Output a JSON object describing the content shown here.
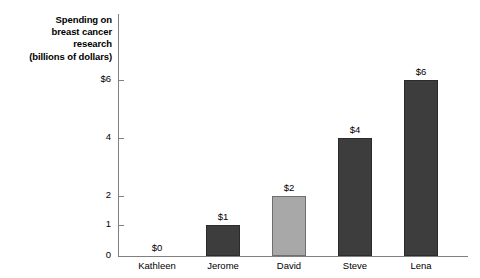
{
  "chart_data": {
    "type": "bar",
    "title": "Spending on breast cancer research (billions of dollars)",
    "title_lines": [
      "Spending on",
      "breast cancer",
      "research",
      "(billions of dollars)"
    ],
    "xlabel": "",
    "ylabel": "Spending on breast cancer research (billions of dollars)",
    "categories": [
      "Kathleen",
      "Jerome",
      "David",
      "Steve",
      "Lena"
    ],
    "values": [
      0,
      1,
      2,
      4,
      6
    ],
    "value_labels": [
      "$0",
      "$1",
      "$2",
      "$4",
      "$6"
    ],
    "bar_styles": [
      "dark",
      "dark",
      "light",
      "dark",
      "dark"
    ],
    "ylim": [
      0,
      6
    ],
    "y_ticks": [
      0,
      1,
      2,
      4,
      6
    ],
    "y_tick_labels": [
      "0",
      "1",
      "2",
      "4",
      "$6"
    ],
    "grid": false,
    "legend": null,
    "colors": {
      "bar_dark": "#3d3d3d",
      "bar_light": "#a8a8a8",
      "bar_outline": "#2b2b2b",
      "axis": "#808080",
      "text": "#000000",
      "background": "#ffffff"
    }
  },
  "geometry": {
    "y_tick_positions": {
      "0": 256,
      "1": 225,
      "2": 196,
      "4": 138,
      "6": 80
    },
    "bar_left": [
      140,
      206,
      272,
      338,
      404
    ],
    "bar_width": 34,
    "baseline": 256
  }
}
